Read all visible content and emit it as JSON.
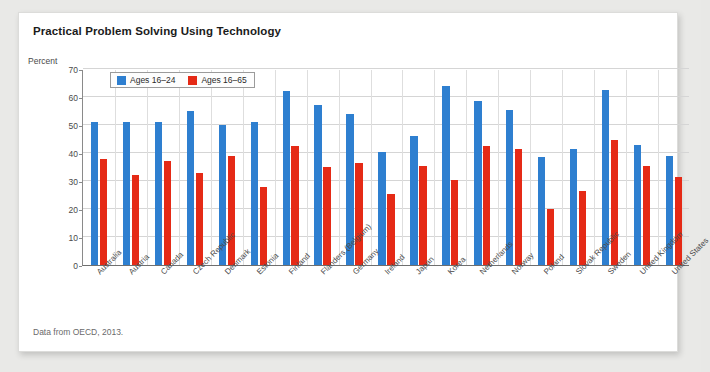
{
  "card": {
    "title": "Practical Problem Solving Using Technology",
    "axis_unit_label": "Percent",
    "footnote": "Data from OECD, 2013."
  },
  "legend": {
    "position": "top-left-inside",
    "entries": [
      {
        "name": "Ages 16–24",
        "color": "#2e7fd0",
        "icon": "legend-swatch-blue"
      },
      {
        "name": "Ages 16–65",
        "color": "#e52a16",
        "icon": "legend-swatch-red"
      }
    ]
  },
  "chart_data": {
    "type": "bar",
    "title": "Practical Problem Solving Using Technology",
    "xlabel": "",
    "ylabel": "Percent",
    "ylim": [
      0,
      70
    ],
    "yticks": [
      0,
      10,
      20,
      30,
      40,
      50,
      60,
      70
    ],
    "grid": true,
    "categories": [
      "Australia",
      "Austria",
      "Canada",
      "Czech Republic",
      "Denmark",
      "Estonia",
      "Finland",
      "Flanders (Belgium)",
      "Germany",
      "Ireland",
      "Japan",
      "Korea",
      "Netherlands",
      "Norway",
      "Poland",
      "Slovak Republic",
      "Sweden",
      "United Kingdom",
      "United States"
    ],
    "series": [
      {
        "name": "Ages 16–24",
        "color": "#2e7fd0",
        "values": [
          51,
          51,
          51,
          55,
          50,
          51,
          62,
          57,
          54,
          40.5,
          46,
          64,
          58.5,
          55.5,
          38.5,
          41.5,
          62.5,
          43,
          39
        ]
      },
      {
        "name": "Ages 16–65",
        "color": "#e52a16",
        "values": [
          38,
          32,
          37,
          33,
          39,
          28,
          42.5,
          35,
          36.5,
          25.5,
          35.5,
          30.5,
          42.5,
          41.5,
          20,
          26.5,
          44.5,
          35.5,
          31.5
        ]
      }
    ]
  }
}
